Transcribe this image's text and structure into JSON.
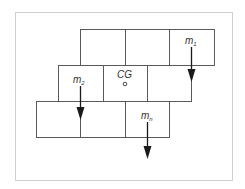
{
  "diagram": {
    "colors": {
      "frame": "#cfcfcf",
      "block_stroke": "#5a5a5a",
      "arrow": "#1a1a1a",
      "text": "#333333"
    },
    "labels": {
      "m1": {
        "base": "m",
        "sub": "1"
      },
      "m2": {
        "base": "m",
        "sub": "2"
      },
      "mn": {
        "base": "m",
        "sub": "n"
      },
      "cg": "CG"
    },
    "rows": [
      {
        "name": "top",
        "cells": 3
      },
      {
        "name": "middle",
        "cells": 3
      },
      {
        "name": "bottom",
        "cells": 3
      }
    ]
  }
}
